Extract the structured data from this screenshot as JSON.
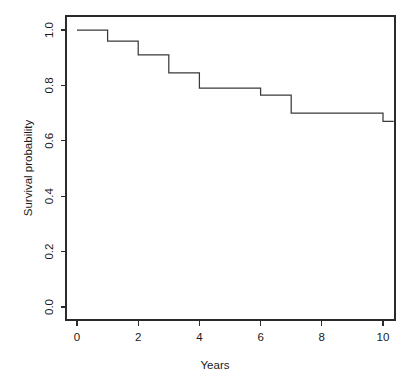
{
  "chart_data": {
    "type": "line",
    "subtype": "kaplan-meier-step",
    "title": "",
    "xlabel": "Years",
    "ylabel": "Survival probability",
    "xlim": [
      -0.35,
      10.35
    ],
    "ylim": [
      0.0,
      1.0
    ],
    "grid": false,
    "legend": null,
    "x_ticks": [
      0,
      2,
      4,
      6,
      8,
      10
    ],
    "x_tick_labels": [
      "0",
      "2",
      "4",
      "6",
      "8",
      "10"
    ],
    "y_ticks": [
      0.0,
      0.2,
      0.4,
      0.6,
      0.8,
      1.0
    ],
    "y_tick_labels": [
      "0.0",
      "0.2",
      "0.4",
      "0.6",
      "0.8",
      "1.0"
    ],
    "line_color": "#3a3a3a",
    "axis_color": "#2b2b2b",
    "background": "#ffffff",
    "x": [
      0,
      1,
      2,
      3,
      4,
      6,
      7,
      10,
      10.35
    ],
    "values": [
      1.0,
      0.96,
      0.91,
      0.845,
      0.79,
      0.765,
      0.7,
      0.67,
      0.67
    ],
    "series": [
      {
        "name": "Survival",
        "steps": [
          {
            "x_start": 0,
            "x_end": 1,
            "y": 1.0
          },
          {
            "x_start": 1,
            "x_end": 2,
            "y": 0.96
          },
          {
            "x_start": 2,
            "x_end": 3,
            "y": 0.91
          },
          {
            "x_start": 3,
            "x_end": 4,
            "y": 0.845
          },
          {
            "x_start": 4,
            "x_end": 6,
            "y": 0.79
          },
          {
            "x_start": 6,
            "x_end": 7,
            "y": 0.765
          },
          {
            "x_start": 7,
            "x_end": 10,
            "y": 0.7
          },
          {
            "x_start": 10,
            "x_end": 10.35,
            "y": 0.67
          }
        ]
      }
    ]
  },
  "axes": {
    "x_title": "Years",
    "y_title": "Survival probability",
    "x_tick_labels": [
      "0",
      "2",
      "4",
      "6",
      "8",
      "10"
    ],
    "y_tick_labels": [
      "0.0",
      "0.2",
      "0.4",
      "0.6",
      "0.8",
      "1.0"
    ]
  }
}
